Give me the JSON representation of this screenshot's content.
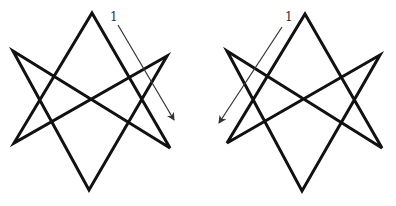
{
  "figures": [
    {
      "name": "left-unicursal-hexagram",
      "vertices": {
        "top": [
          92,
          13
        ],
        "upper_left": [
          13,
          51
        ],
        "upper_right": [
          167,
          56
        ],
        "lower_left": [
          14,
          143
        ],
        "lower_right": [
          170,
          148
        ],
        "bottom": [
          89,
          190
        ]
      },
      "arrow": {
        "from": [
          118,
          25
        ],
        "to": [
          174,
          120
        ]
      },
      "label": {
        "text": "1",
        "x": 110,
        "y": 11
      },
      "direction": "clockwise"
    },
    {
      "name": "right-unicursal-hexagram",
      "vertices": {
        "top": [
          305,
          14
        ],
        "upper_left": [
          227,
          51
        ],
        "upper_right": [
          380,
          55
        ],
        "lower_left": [
          227,
          143
        ],
        "lower_right": [
          382,
          148
        ],
        "bottom": [
          302,
          191
        ]
      },
      "arrow": {
        "from": [
          282,
          27
        ],
        "to": [
          219,
          123
        ]
      },
      "label": {
        "text": "1",
        "x": 285,
        "y": 11
      },
      "direction": "counterclockwise"
    }
  ],
  "colors": {
    "stroke": "#111111",
    "arrow": "#333333",
    "background": "#ffffff"
  }
}
